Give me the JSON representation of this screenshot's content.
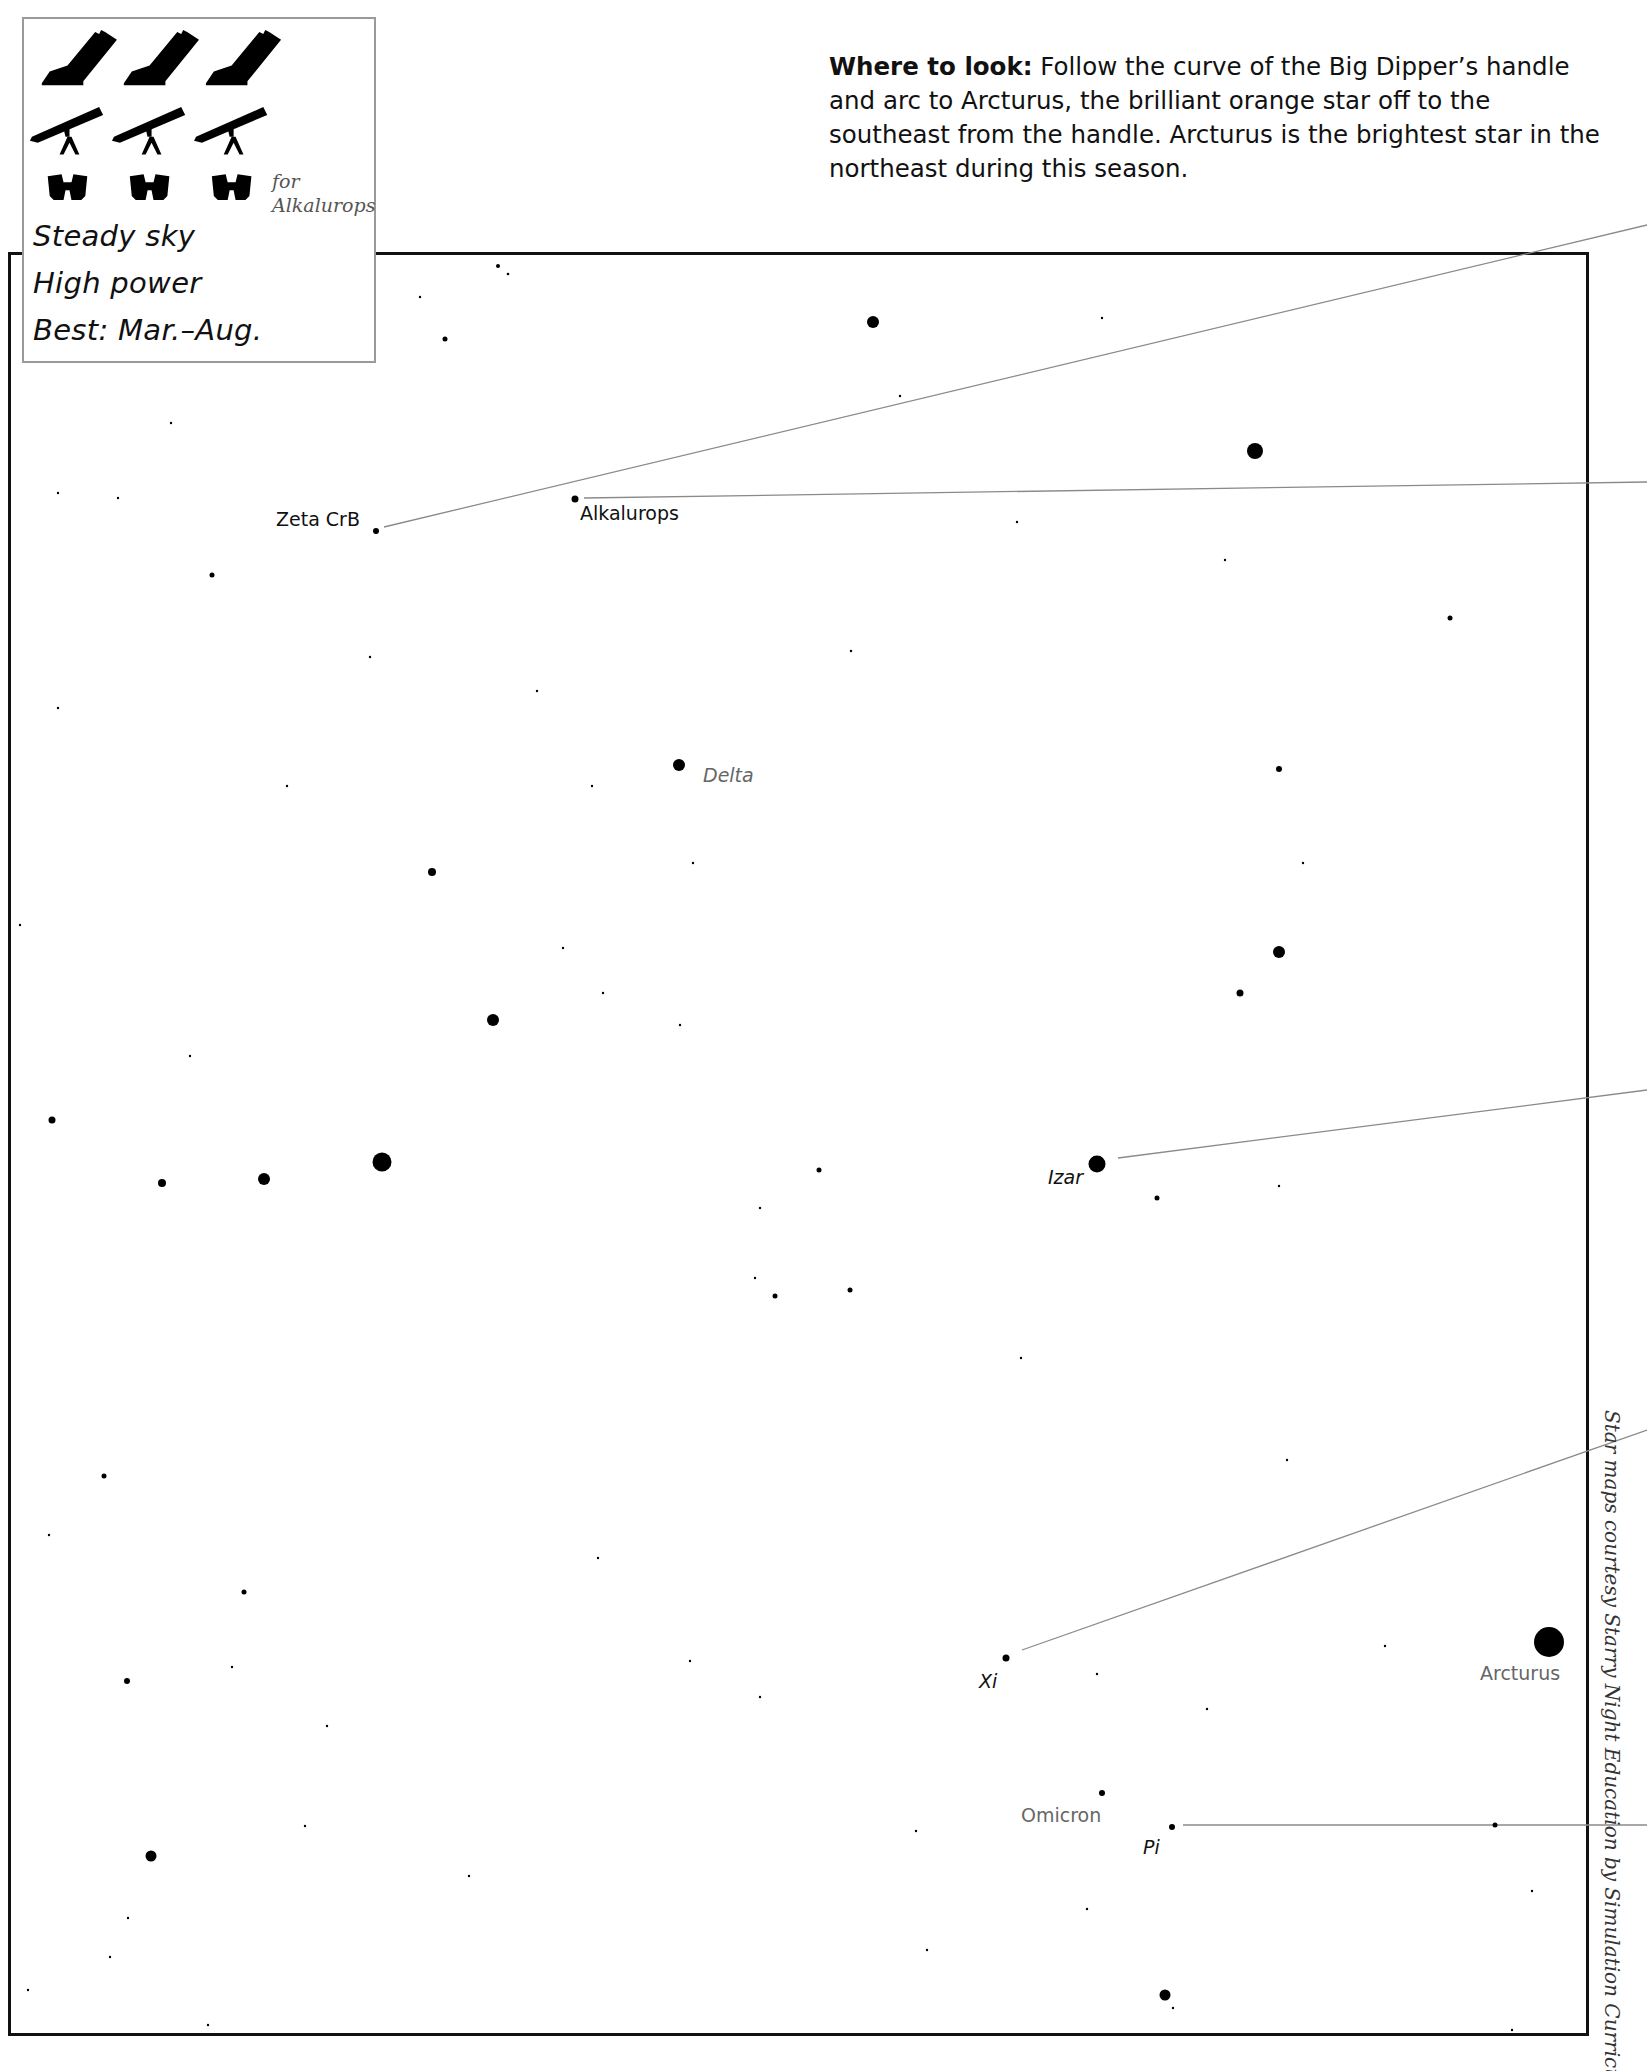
{
  "legend": {
    "equipment": [
      {
        "type": "dobsonian-telescope",
        "count": 3
      },
      {
        "type": "refractor-telescope",
        "count": 3
      },
      {
        "type": "binoculars",
        "count": 3
      }
    ],
    "binocular_note_line1": "for",
    "binocular_note_line2": "Alkalurops",
    "conditions": [
      "Steady sky",
      "High power",
      "Best: Mar.–Aug."
    ]
  },
  "where_to_look": {
    "heading": "Where to look:",
    "text": " Follow the curve of the Big Dipper’s handle and arc to Arcturus, the brilliant orange star off to the southeast from the handle. Arcturus is the brightest star in the northeast during this season."
  },
  "credit": "Star maps courtesy Starry Night Education by Simulation Curriculum",
  "labels": {
    "zeta_crb": "Zeta CrB",
    "alkalurops": "Alkalurops",
    "delta": "Delta",
    "izar": "Izar",
    "xi": "Xi",
    "arcturus": "Arcturus",
    "omicron": "Omicron",
    "pi": "Pi"
  },
  "colors": {
    "frame": "#111111",
    "star": "#000000",
    "pointer_line": "#8a8a8a",
    "gray_label": "#666666",
    "legend_border": "#9a9a9a"
  },
  "named_stars": [
    {
      "name": "Zeta CrB",
      "x": 376,
      "y": 531,
      "r": 3
    },
    {
      "name": "Alkalurops",
      "x": 575,
      "y": 499,
      "r": 3.5
    },
    {
      "name": "Delta",
      "x": 679,
      "y": 765,
      "r": 6
    },
    {
      "name": "Izar",
      "x": 1097,
      "y": 1164,
      "r": 8
    },
    {
      "name": "Xi",
      "x": 1006,
      "y": 1658,
      "r": 3.5
    },
    {
      "name": "Arcturus",
      "x": 1549,
      "y": 1642,
      "r": 15
    },
    {
      "name": "Omicron",
      "x": 1102,
      "y": 1793,
      "r": 3
    },
    {
      "name": "Pi",
      "x": 1172,
      "y": 1827,
      "r": 3
    }
  ]
}
